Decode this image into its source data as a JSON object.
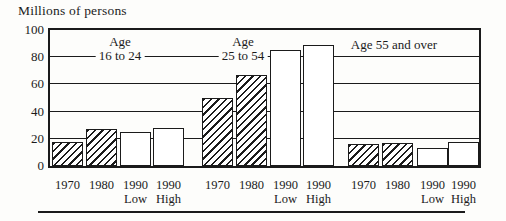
{
  "colors": {
    "ink": "#1b1b1b",
    "background": "#fdfdfb",
    "bar_fill": "#ffffff"
  },
  "chart_data": {
    "type": "bar",
    "title": "Millions of persons",
    "ylabel": "Millions of persons",
    "xlabel": "",
    "ylim": [
      0,
      100
    ],
    "yticks": [
      0,
      20,
      40,
      60,
      80,
      100
    ],
    "gridlines": [
      20,
      40,
      60,
      80
    ],
    "grid": "horizontal",
    "legend_position": "none",
    "categories": [
      {
        "id": "1970",
        "year": "1970",
        "sub": ""
      },
      {
        "id": "1980",
        "year": "1980",
        "sub": ""
      },
      {
        "id": "1990-low",
        "year": "1990",
        "sub": "Low"
      },
      {
        "id": "1990-high",
        "year": "1990",
        "sub": "High"
      }
    ],
    "groups": [
      {
        "id": "age-16-24",
        "label_lines": [
          "Age",
          "16 to 24"
        ],
        "values": [
          18,
          27,
          25,
          28
        ],
        "pattern": [
          "hatched",
          "hatched",
          "open",
          "open"
        ]
      },
      {
        "id": "age-25-54",
        "label_lines": [
          "Age",
          "25 to 54"
        ],
        "values": [
          50,
          67,
          85,
          89
        ],
        "pattern": [
          "hatched",
          "hatched",
          "open",
          "open"
        ]
      },
      {
        "id": "age-55-over",
        "label_lines": [
          "Age 55 and over"
        ],
        "values": [
          16,
          17,
          13,
          18
        ],
        "pattern": [
          "hatched",
          "hatched",
          "open",
          "open"
        ]
      }
    ]
  }
}
